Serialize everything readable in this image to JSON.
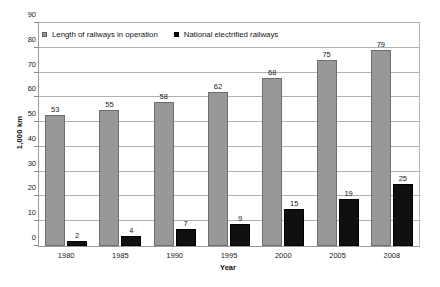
{
  "chart_data": {
    "type": "bar",
    "title": "",
    "subtitle": "",
    "xlabel": "Year",
    "ylabel": "1,000 km",
    "categories": [
      "1980",
      "1985",
      "1990",
      "1995",
      "2000",
      "2005",
      "2008"
    ],
    "series": [
      {
        "name": "Length of railways in operation",
        "color": "#989898",
        "values": [
          53,
          55,
          58,
          62,
          68,
          75,
          79
        ]
      },
      {
        "name": "National electrified railways",
        "color": "#101010",
        "values": [
          2,
          4,
          7,
          9,
          15,
          19,
          25
        ]
      }
    ],
    "ylim": [
      0,
      90
    ],
    "y_ticks": [
      0,
      10,
      20,
      30,
      40,
      50,
      60,
      70,
      80,
      90
    ],
    "y_tick_labels": [
      "0",
      "10",
      "20",
      "30",
      "40",
      "50",
      "60",
      "70",
      "80",
      "90"
    ],
    "grid": true,
    "grid_axis": "y",
    "legend_position": "top-left-inside",
    "data_labels": true,
    "plot_background": "#ffffff",
    "grid_color": "#b0b0b0",
    "frame_color": "#9b9b9b"
  },
  "legend": {
    "entries": [
      {
        "label": "Length of railways in operation",
        "swatch": "legend-swatch-gray"
      },
      {
        "label": "National electrified railways",
        "swatch": "legend-swatch-black"
      }
    ]
  },
  "axes": {
    "x_title": "Year",
    "y_title": "1,000 km"
  }
}
